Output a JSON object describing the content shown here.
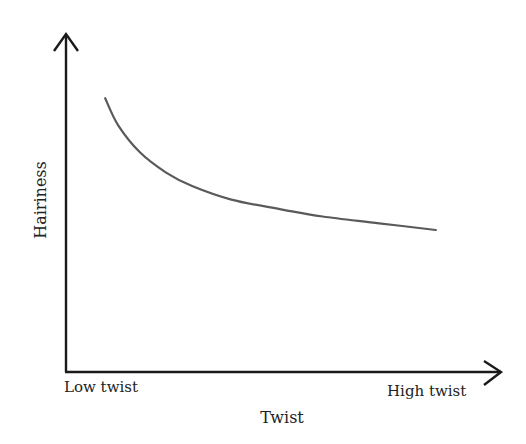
{
  "chart_data": {
    "type": "line",
    "title": "",
    "xlabel": "Twist",
    "ylabel": "Hairiness",
    "x_tick_labels": {
      "low": "Low twist",
      "high": "High twist"
    },
    "x_range": [
      0,
      1
    ],
    "y_range": [
      0,
      1
    ],
    "grid": false,
    "legend": "none",
    "series": [
      {
        "name": "Hairiness vs twist",
        "description": "Hairiness decreases steeply at low twist then levels off (decaying curve)",
        "x": [
          0.09,
          0.12,
          0.17,
          0.23,
          0.29,
          0.38,
          0.5,
          0.59,
          0.72,
          0.85
        ],
        "y": [
          0.81,
          0.73,
          0.65,
          0.59,
          0.55,
          0.51,
          0.48,
          0.46,
          0.44,
          0.42
        ]
      }
    ],
    "colors": {
      "axis": "#1a1a1a",
      "curve": "#5a5a5a",
      "text": "#222222"
    }
  }
}
